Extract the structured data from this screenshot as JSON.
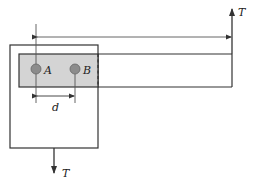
{
  "diagram": {
    "labels": {
      "pin_a": "A",
      "pin_b": "B",
      "spacing": "d",
      "tension_top": "T",
      "tension_bottom": "T"
    },
    "colors": {
      "line": "#333333",
      "strip_fill": "#d4d4d4",
      "pin_fill": "#8c8c8c",
      "background": "#ffffff"
    }
  }
}
